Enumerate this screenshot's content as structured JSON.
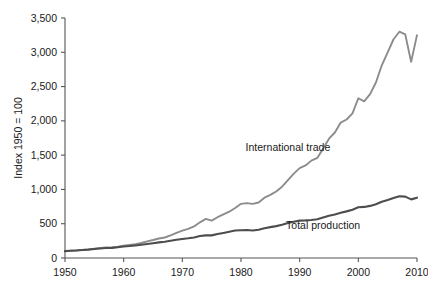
{
  "chart_data": {
    "type": "line",
    "title": "",
    "subtitle": "",
    "xlabel": "",
    "ylabel": "Index 1950 = 100",
    "xlim": [
      1950,
      2010
    ],
    "ylim": [
      0,
      3500
    ],
    "grid": false,
    "legend_position": "inline-annotations",
    "x_ticks": [
      1950,
      1960,
      1970,
      1980,
      1990,
      2000,
      2010
    ],
    "x_tick_labels": [
      "1950",
      "1960",
      "1970",
      "1980",
      "1990",
      "2000",
      "2010"
    ],
    "y_ticks": [
      0,
      500,
      1000,
      1500,
      2000,
      2500,
      3000,
      3500
    ],
    "y_tick_labels": [
      "0",
      "500",
      "1,000",
      "1,500",
      "2,000",
      "2,500",
      "3,000",
      "3,500"
    ],
    "series": [
      {
        "name": "International trade",
        "color": "#8c8c8c",
        "label_x": 1988,
        "label_y": 1560,
        "x": [
          1950,
          1951,
          1952,
          1953,
          1954,
          1955,
          1956,
          1957,
          1958,
          1959,
          1960,
          1961,
          1962,
          1963,
          1964,
          1965,
          1966,
          1967,
          1968,
          1969,
          1970,
          1971,
          1972,
          1973,
          1974,
          1975,
          1976,
          1977,
          1978,
          1979,
          1980,
          1981,
          1982,
          1983,
          1984,
          1985,
          1986,
          1987,
          1988,
          1989,
          1990,
          1991,
          1992,
          1993,
          1994,
          1995,
          1996,
          1997,
          1998,
          1999,
          2000,
          2001,
          2002,
          2003,
          2004,
          2005,
          2006,
          2007,
          2008,
          2009,
          2010
        ],
        "values": [
          100,
          108,
          112,
          118,
          126,
          137,
          147,
          155,
          153,
          165,
          180,
          191,
          203,
          219,
          243,
          263,
          285,
          299,
          330,
          367,
          400,
          424,
          460,
          520,
          570,
          545,
          595,
          635,
          675,
          730,
          790,
          800,
          790,
          810,
          880,
          920,
          970,
          1040,
          1135,
          1230,
          1310,
          1350,
          1420,
          1460,
          1595,
          1740,
          1830,
          1975,
          2020,
          2110,
          2330,
          2285,
          2390,
          2560,
          2810,
          3000,
          3190,
          3300,
          3260,
          2860,
          3250
        ]
      },
      {
        "name": "Total production",
        "color": "#4d4d4d",
        "label_x": 1994,
        "label_y": 430,
        "x": [
          1950,
          1951,
          1952,
          1953,
          1954,
          1955,
          1956,
          1957,
          1958,
          1959,
          1960,
          1961,
          1962,
          1963,
          1964,
          1965,
          1966,
          1967,
          1968,
          1969,
          1970,
          1971,
          1972,
          1973,
          1974,
          1975,
          1976,
          1977,
          1978,
          1979,
          1980,
          1981,
          1982,
          1983,
          1984,
          1985,
          1986,
          1987,
          1988,
          1989,
          1990,
          1991,
          1992,
          1993,
          1994,
          1995,
          1996,
          1997,
          1998,
          1999,
          2000,
          2001,
          2002,
          2003,
          2004,
          2005,
          2006,
          2007,
          2008,
          2009,
          2010
        ],
        "values": [
          100,
          106,
          110,
          116,
          122,
          131,
          139,
          145,
          148,
          157,
          167,
          174,
          183,
          192,
          205,
          216,
          228,
          237,
          251,
          266,
          278,
          287,
          300,
          320,
          330,
          330,
          350,
          365,
          382,
          400,
          405,
          408,
          402,
          412,
          435,
          450,
          465,
          485,
          510,
          530,
          545,
          548,
          555,
          565,
          590,
          615,
          635,
          660,
          680,
          705,
          740,
          745,
          760,
          785,
          820,
          845,
          875,
          900,
          895,
          855,
          880
        ]
      }
    ]
  },
  "axis": {
    "y_title": "Index 1950 = 100"
  }
}
